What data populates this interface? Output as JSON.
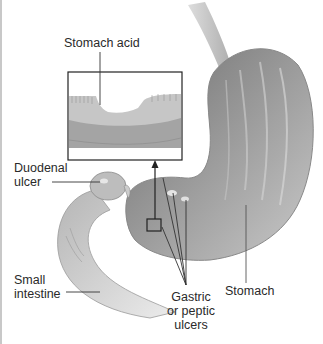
{
  "figure": {
    "labels": {
      "stomach_acid": "Stomach acid",
      "duodenal_ulcer": "Duodenal\nulcer",
      "small_intestine": "Small\nintestine",
      "gastric_ulcers": "Gastric\nor peptic\nulcers",
      "stomach": "Stomach"
    },
    "colors": {
      "tissue_dark": "#7a7a7a",
      "tissue_mid": "#a8a8a8",
      "tissue_light": "#d9d9d9",
      "leader_line": "#333333",
      "background": "#ffffff"
    }
  }
}
